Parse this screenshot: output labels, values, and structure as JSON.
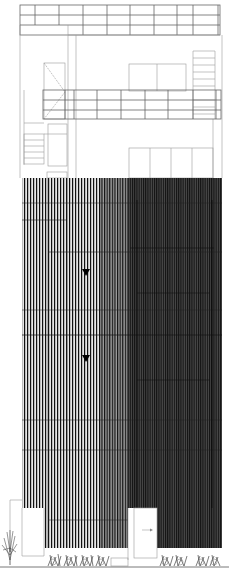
{
  "drawing": {
    "type": "architectural-elevation",
    "width": 229,
    "height": 577,
    "colors": {
      "background": "#ffffff",
      "line_light": "#9a9a9a",
      "line_medium": "#666666",
      "slat_dark": "#1a1a1a",
      "slat_light_bg": "#d9d9d9",
      "slat_dark_bg": "#3a3a3a",
      "ground": "#555555"
    },
    "elements": {
      "roof_pergola": {
        "x": 20,
        "y": 5,
        "w": 200,
        "h": 30,
        "columns": 9,
        "rows": 2
      },
      "upper_balcony_railing": {
        "x": 43,
        "y": 90,
        "w": 178,
        "h": 29,
        "rows": 3
      },
      "upper_sliding_door": {
        "x": 129,
        "y": 64,
        "w": 57,
        "h": 27,
        "panels": 2
      },
      "side_ladder": {
        "x": 193,
        "y": 51,
        "w": 22,
        "h": 68,
        "rungs": 10
      },
      "lower_sliding_door": {
        "x": 129,
        "y": 148,
        "w": 84,
        "h": 30,
        "panels": 4
      },
      "left_stair": {
        "x": 24,
        "y": 123,
        "w": 20,
        "h": 50
      },
      "facade_screen": {
        "x": 22,
        "y": 178,
        "w": 200,
        "h": 370
      },
      "level_markers": [
        {
          "name": "level-marker-1",
          "x": 86,
          "y": 271
        },
        {
          "name": "level-marker-2",
          "x": 86,
          "y": 357
        }
      ],
      "entrance_door": {
        "x": 128,
        "y": 507,
        "w": 29,
        "h": 50
      },
      "ground_line_y": 567
    }
  }
}
